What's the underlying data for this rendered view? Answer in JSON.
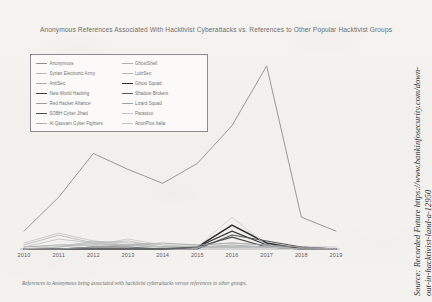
{
  "chart_data": {
    "type": "line",
    "title": "Anonymous References Associated With Hacktivist Cyberattacks vs. References to Other Popular Hacktivist Groups",
    "xlabel": "",
    "ylabel": "",
    "categories": [
      "2010",
      "2011",
      "2012",
      "2013",
      "2014",
      "2015",
      "2016",
      "2017",
      "2018",
      "2019"
    ],
    "x": [
      2010,
      2011,
      2012,
      2013,
      2014,
      2015,
      2016,
      2017,
      2018,
      2019
    ],
    "ylim": [
      0,
      100
    ],
    "grid": false,
    "legend_position": "top-left-inside",
    "series": [
      {
        "name": "Anonymous",
        "color": "#8d8f91",
        "width": 0.9,
        "values": [
          9,
          26,
          48,
          40,
          33,
          43,
          62,
          92,
          16,
          9
        ]
      },
      {
        "name": "Syrian Electronic Army",
        "color": "#b9babc",
        "width": 0.7,
        "values": [
          3,
          8,
          4,
          3,
          2,
          2,
          3,
          2,
          1,
          1
        ]
      },
      {
        "name": "AntiSec",
        "color": "#a8aaac",
        "width": 0.7,
        "values": [
          2,
          7,
          3,
          2,
          1,
          1,
          1,
          1,
          1,
          0
        ]
      },
      {
        "name": "New World Hacking",
        "color": "#3d3e40",
        "width": 1.3,
        "values": [
          0,
          0,
          0,
          0,
          0,
          1,
          9,
          2,
          0,
          0
        ]
      },
      {
        "name": "Red Hacker Alliance",
        "color": "#9b9d9f",
        "width": 0.8,
        "values": [
          1,
          2,
          2,
          2,
          1,
          1,
          2,
          1,
          1,
          0
        ]
      },
      {
        "name": "SOBH Cyber Jihad",
        "color": "#4a4b4d",
        "width": 1.2,
        "values": [
          0,
          0,
          1,
          1,
          0,
          1,
          6,
          1,
          0,
          0
        ]
      },
      {
        "name": "Al Qassam Cyber Fighters",
        "color": "#acaeb0",
        "width": 0.7,
        "values": [
          0,
          1,
          3,
          4,
          1,
          1,
          1,
          1,
          0,
          0
        ]
      },
      {
        "name": "GhostShell",
        "color": "#aeb0b2",
        "width": 0.7,
        "values": [
          0,
          1,
          4,
          2,
          1,
          1,
          1,
          1,
          0,
          0
        ]
      },
      {
        "name": "LulzSec",
        "color": "#b5b7b9",
        "width": 0.7,
        "values": [
          1,
          5,
          3,
          1,
          1,
          1,
          1,
          1,
          0,
          0
        ]
      },
      {
        "name": "Ghost Squad",
        "color": "#2b2c2e",
        "width": 1.5,
        "values": [
          0,
          0,
          0,
          0,
          0,
          1,
          12,
          3,
          0,
          0
        ]
      },
      {
        "name": "Shadow Brokers",
        "color": "#56575a",
        "width": 1.1,
        "values": [
          0,
          0,
          0,
          0,
          0,
          0,
          7,
          4,
          1,
          0
        ]
      },
      {
        "name": "Lizard Squad",
        "color": "#9fa1a3",
        "width": 0.8,
        "values": [
          0,
          0,
          1,
          2,
          3,
          2,
          3,
          2,
          1,
          0
        ]
      },
      {
        "name": "Parastoo",
        "color": "#c0c2c4",
        "width": 0.7,
        "values": [
          0,
          1,
          2,
          5,
          2,
          1,
          1,
          1,
          0,
          0
        ]
      },
      {
        "name": "AnonPlus Italia",
        "color": "#c5c7c9",
        "width": 0.7,
        "values": [
          0,
          2,
          3,
          2,
          1,
          1,
          16,
          2,
          0,
          0
        ]
      }
    ]
  },
  "legend": {
    "columns": [
      [
        {
          "label": "Anonymous"
        },
        {
          "label": "Syrian Electronic Army"
        },
        {
          "label": "AntiSec"
        },
        {
          "label": "New World Hacking"
        },
        {
          "label": "Red Hacker Alliance"
        },
        {
          "label": "SOBH Cyber Jihad"
        },
        {
          "label": "Al Qassam Cyber Fighters"
        }
      ],
      [
        {
          "label": "GhostShell"
        },
        {
          "label": "LulzSec"
        },
        {
          "label": "Ghost Squad"
        },
        {
          "label": "Shadow Brokers"
        },
        {
          "label": "Lizard Squad"
        },
        {
          "label": "Parastoo"
        },
        {
          "label": "AnonPlus Italia"
        }
      ]
    ]
  },
  "caption": "References to Anonymous being associated with hacktivist cyberattacks versus references to other groups.",
  "source": {
    "line1": "Source: Recorded Future https://www.bankinfosecurity.com/down-",
    "line2": "out-in-hacktivist-land-a-12950"
  }
}
